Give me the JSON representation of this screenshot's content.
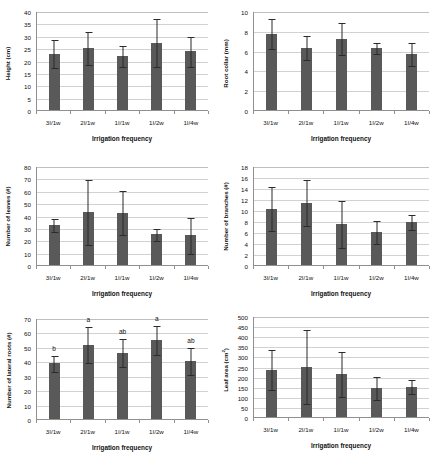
{
  "figure": {
    "xlabel": "Irrigation frequency",
    "categories": [
      "3I/1w",
      "2I/1w",
      "1I/1w",
      "1I/2w",
      "1I/4w"
    ],
    "bar_color": "#595959",
    "error_bar_color": "#2b2b2b",
    "gridline_color": "#d2d2d2",
    "axis_color": "#909090",
    "background": "#ffffff"
  },
  "chart_data": [
    {
      "type": "bar",
      "panel": "top-left",
      "title": "",
      "ylabel": "Height (cm)",
      "ylabel_unit": "",
      "xlabel": "Irrigation frequency",
      "categories": [
        "3I/1w",
        "2I/1w",
        "1I/1w",
        "1I/2w",
        "1I/4w"
      ],
      "values": [
        22.7,
        25.1,
        21.9,
        27.2,
        23.7
      ],
      "errors": [
        5.8,
        7.0,
        4.5,
        9.8,
        6.2
      ],
      "yticks": [
        0,
        5,
        10,
        15,
        20,
        25,
        30,
        35,
        40
      ],
      "ylim": [
        0,
        40
      ],
      "grid": true,
      "legend": "none",
      "annotations": []
    },
    {
      "type": "bar",
      "panel": "top-right",
      "title": "",
      "ylabel": "Root collar  (mm)",
      "ylabel_unit": "",
      "xlabel": "Irrigation frequency",
      "categories": [
        "3I/1w",
        "2I/1w",
        "1I/1w",
        "1I/2w",
        "1I/4w"
      ],
      "values": [
        7.7,
        6.3,
        7.2,
        6.3,
        5.65
      ],
      "errors": [
        1.55,
        1.3,
        1.65,
        0.6,
        1.25
      ],
      "yticks": [
        0,
        2,
        4,
        6,
        8,
        10
      ],
      "ylim": [
        0,
        10
      ],
      "grid": true,
      "legend": "none",
      "annotations": []
    },
    {
      "type": "bar",
      "panel": "middle-left",
      "title": "",
      "ylabel": "Number of leaves  (#)",
      "ylabel_unit": "",
      "xlabel": "Irrigation frequency",
      "categories": [
        "3I/1w",
        "2I/1w",
        "1I/1w",
        "1I/2w",
        "1I/4w"
      ],
      "values": [
        32.5,
        43.0,
        42.3,
        24.7,
        24.0
      ],
      "errors": [
        5.8,
        26.8,
        18.3,
        5.3,
        15.0
      ],
      "yticks": [
        0,
        10,
        20,
        30,
        40,
        50,
        60,
        70,
        80
      ],
      "ylim": [
        0,
        80
      ],
      "grid": true,
      "legend": "none",
      "annotations": []
    },
    {
      "type": "bar",
      "panel": "middle-right",
      "title": "",
      "ylabel": "Number of branches  (#)",
      "ylabel_unit": "",
      "xlabel": "Irrigation frequency",
      "categories": [
        "3I/1w",
        "2I/1w",
        "1I/1w",
        "1I/2w",
        "1I/4w"
      ],
      "values": [
        10.2,
        11.3,
        7.5,
        6.0,
        7.8
      ],
      "errors": [
        4.1,
        4.3,
        4.4,
        2.1,
        1.5
      ],
      "yticks": [
        0,
        2,
        4,
        6,
        8,
        10,
        12,
        14,
        16,
        18
      ],
      "ylim": [
        0,
        18
      ],
      "grid": true,
      "legend": "none",
      "annotations": []
    },
    {
      "type": "bar",
      "panel": "bottom-left",
      "title": "",
      "ylabel": "Number of lateral roots  (#)",
      "ylabel_unit": "",
      "xlabel": "Irrigation frequency",
      "categories": [
        "3I/1w",
        "2I/1w",
        "1I/1w",
        "1I/2w",
        "1I/4w"
      ],
      "values": [
        38.5,
        51.5,
        46.0,
        54.8,
        40.3
      ],
      "errors": [
        5.8,
        13.0,
        10.0,
        10.5,
        9.8
      ],
      "yticks": [
        0,
        10,
        20,
        30,
        40,
        50,
        60,
        70
      ],
      "ylim": [
        0,
        70
      ],
      "grid": true,
      "legend": "none",
      "annotations": [
        "b",
        "a",
        "ab",
        "a",
        "ab"
      ]
    },
    {
      "type": "bar",
      "panel": "bottom-right",
      "title": "",
      "ylabel": "Leaf area  (cm",
      "ylabel_unit": "2",
      "ylabel_suffix": ")",
      "xlabel": "Irrigation frequency",
      "categories": [
        "3I/1w",
        "2I/1w",
        "1I/1w",
        "1I/2w",
        "1I/4w"
      ],
      "values": [
        235,
        250,
        213,
        142,
        150
      ],
      "errors": [
        100,
        185,
        113,
        60,
        37
      ],
      "yticks": [
        0,
        50,
        100,
        150,
        200,
        250,
        300,
        350,
        400,
        450,
        500
      ],
      "ylim": [
        0,
        500
      ],
      "grid": true,
      "legend": "none",
      "annotations": []
    }
  ]
}
